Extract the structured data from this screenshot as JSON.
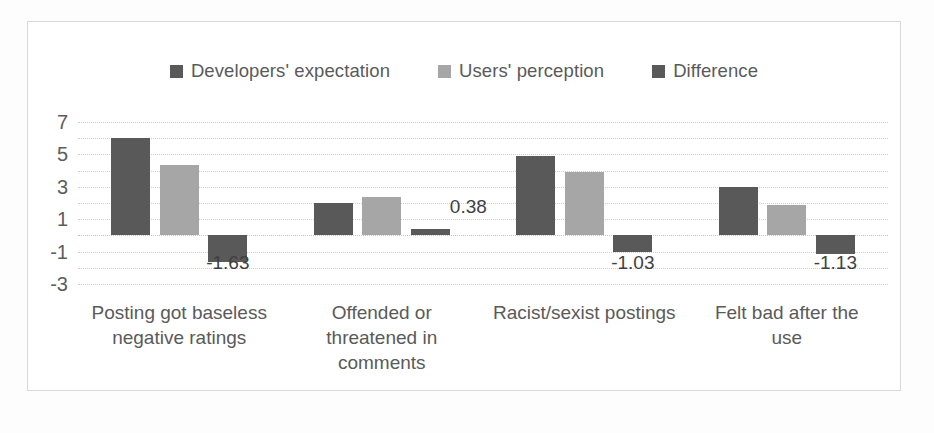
{
  "chart_data": {
    "type": "bar",
    "title": "",
    "subtitle": "",
    "xlabel": "",
    "ylabel": "",
    "grid": true,
    "legend_position": "top-center",
    "ylim": [
      -3,
      7
    ],
    "yticks": [
      7,
      5,
      3,
      1,
      -1,
      -3
    ],
    "ytick_labels": [
      "7",
      "5",
      "3",
      "1",
      "-1",
      "-3"
    ],
    "categories": [
      "Posting got baseless negative ratings",
      "Offended or threatened in comments",
      "Racist/sexist postings",
      "Felt bad after the use"
    ],
    "category_lines": [
      [
        "Posting got baseless",
        "negative ratings"
      ],
      [
        "Offended or",
        "threatened in",
        "comments"
      ],
      [
        "Racist/sexist postings"
      ],
      [
        "Felt bad after the",
        "use"
      ]
    ],
    "series": [
      {
        "name": "Developers' expectation",
        "color": "#595959",
        "values": [
          6.0,
          2.0,
          4.93,
          3.0
        ]
      },
      {
        "name": "Users' perception",
        "color": "#a6a6a6",
        "values": [
          4.37,
          2.38,
          3.9,
          1.87
        ]
      },
      {
        "name": "Difference",
        "color": "#595959",
        "values": [
          -1.63,
          0.38,
          -1.03,
          -1.13
        ],
        "data_labels": [
          "-1.63",
          "0.38",
          "-1.03",
          "-1.13"
        ]
      }
    ],
    "annotations": [
      {
        "text": "-1.63",
        "category": "Posting got baseless negative ratings",
        "series": "Difference"
      },
      {
        "text": "0.38",
        "category": "Offended or threatened in comments",
        "series": "Difference"
      },
      {
        "text": "-1.03",
        "category": "Racist/sexist postings",
        "series": "Difference"
      },
      {
        "text": "-1.13",
        "category": "Felt bad after the use",
        "series": "Difference"
      }
    ]
  },
  "legend": {
    "items": [
      {
        "label": "Developers' expectation",
        "color": "#595959"
      },
      {
        "label": "Users' perception",
        "color": "#a6a6a6"
      },
      {
        "label": "Difference",
        "color": "#595959"
      }
    ]
  },
  "axis": {
    "y_labels": [
      "7",
      "5",
      "3",
      "1",
      "-1",
      "-3"
    ]
  },
  "data_labels": {
    "g0": "-1.63",
    "g1": "0.38",
    "g2": "-1.03",
    "g3": "-1.13"
  },
  "categories": {
    "c0_l0": "Posting got baseless",
    "c0_l1": "negative ratings",
    "c1_l0": "Offended or",
    "c1_l1": "threatened in",
    "c1_l2": "comments",
    "c2_l0": "Racist/sexist postings",
    "c3_l0": "Felt bad after the",
    "c3_l1": "use"
  }
}
